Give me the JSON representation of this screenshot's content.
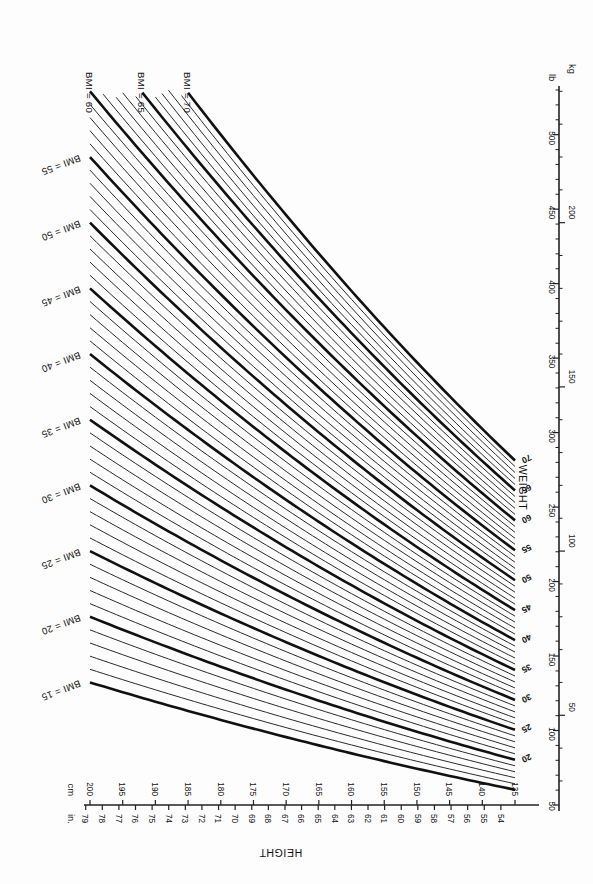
{
  "figure": {
    "orientation": "rotated-180"
  },
  "height_axis": {
    "name": "HEIGHT",
    "unit_left": "in.",
    "unit_right": "cm",
    "in_ticks": [
      80,
      79,
      78,
      77,
      76,
      75,
      74,
      73,
      72,
      71,
      70,
      69,
      68,
      67,
      66,
      65,
      64,
      63,
      62,
      61,
      60,
      59,
      58,
      57,
      56,
      55,
      54
    ],
    "cm_ticks": [
      200,
      195,
      190,
      185,
      180,
      175,
      170,
      165,
      160,
      155,
      150,
      145,
      140,
      135
    ],
    "in_min": 54,
    "in_max": 80,
    "cm_min": 135,
    "cm_max": 200
  },
  "weight_axis": {
    "name": "WEIGHT",
    "unit_left": "kg",
    "unit_right": "lb",
    "lb_ticks": [
      50,
      100,
      150,
      200,
      250,
      300,
      350,
      400,
      450,
      500
    ],
    "lb_minor_step": 10,
    "kg_ticks": [
      50,
      100,
      150,
      200
    ],
    "kg_minor_step": 10,
    "lb_min": 50,
    "lb_max": 530,
    "kg_min": 23,
    "kg_max": 240
  },
  "bmi_labels_left": [
    {
      "text": "BMI = 15",
      "value": 15
    },
    {
      "text": "BMI = 20",
      "value": 20
    },
    {
      "text": "BMI = 25",
      "value": 25
    },
    {
      "text": "BMI = 30",
      "value": 30
    },
    {
      "text": "BMI = 35",
      "value": 35
    },
    {
      "text": "BMI = 40",
      "value": 40
    },
    {
      "text": "BMI = 45",
      "value": 45
    },
    {
      "text": "BMI = 50",
      "value": 50
    },
    {
      "text": "BMI = 55",
      "value": 55
    }
  ],
  "bmi_labels_top": [
    {
      "text": "BMI = 60",
      "value": 60
    },
    {
      "text": "BMI = 65",
      "value": 65
    },
    {
      "text": "BMI = 70",
      "value": 70
    }
  ],
  "bmi_end_labels": [
    "20",
    "25",
    "30",
    "35",
    "40",
    "45",
    "50",
    "55",
    "60",
    "65",
    "70"
  ],
  "colors": {
    "background": "#fdfdfd",
    "line": "#2a2a2a",
    "line_major": "#111111",
    "axis": "#222222",
    "text": "#111111"
  },
  "chart_data": {
    "type": "line",
    "xlabel": "HEIGHT",
    "ylabel": "WEIGHT",
    "x_units": [
      "in.",
      "cm"
    ],
    "y_units": [
      "lb",
      "kg"
    ],
    "xlim_in": [
      54,
      80
    ],
    "xlim_cm": [
      135,
      200
    ],
    "ylim_lb": [
      50,
      530
    ],
    "ylim_kg": [
      23,
      240
    ],
    "grid": false,
    "legend": "inline-labels",
    "note": "Each line is an iso-BMI curve: weight_kg = BMI * (height_m)^2",
    "series": [
      {
        "name": "BMI = 15",
        "bmi": 15,
        "major": true,
        "w_kg_at_135cm": 27.3,
        "w_kg_at_200cm": 60.0
      },
      {
        "name": "BMI = 16",
        "bmi": 16,
        "major": false,
        "w_kg_at_135cm": 29.2,
        "w_kg_at_200cm": 64.0
      },
      {
        "name": "BMI = 17",
        "bmi": 17,
        "major": false,
        "w_kg_at_135cm": 31.0,
        "w_kg_at_200cm": 68.0
      },
      {
        "name": "BMI = 18",
        "bmi": 18,
        "major": false,
        "w_kg_at_135cm": 32.8,
        "w_kg_at_200cm": 72.0
      },
      {
        "name": "BMI = 19",
        "bmi": 19,
        "major": false,
        "w_kg_at_135cm": 34.6,
        "w_kg_at_200cm": 76.0
      },
      {
        "name": "BMI = 20",
        "bmi": 20,
        "major": true,
        "w_kg_at_135cm": 36.5,
        "w_kg_at_200cm": 80.0
      },
      {
        "name": "BMI = 21",
        "bmi": 21,
        "major": false,
        "w_kg_at_135cm": 38.3,
        "w_kg_at_200cm": 84.0
      },
      {
        "name": "BMI = 22",
        "bmi": 22,
        "major": false,
        "w_kg_at_135cm": 40.1,
        "w_kg_at_200cm": 88.0
      },
      {
        "name": "BMI = 23",
        "bmi": 23,
        "major": false,
        "w_kg_at_135cm": 41.9,
        "w_kg_at_200cm": 92.0
      },
      {
        "name": "BMI = 24",
        "bmi": 24,
        "major": false,
        "w_kg_at_135cm": 43.7,
        "w_kg_at_200cm": 96.0
      },
      {
        "name": "BMI = 25",
        "bmi": 25,
        "major": true,
        "w_kg_at_135cm": 45.6,
        "w_kg_at_200cm": 100.0
      },
      {
        "name": "BMI = 26",
        "bmi": 26,
        "major": false,
        "w_kg_at_135cm": 47.4,
        "w_kg_at_200cm": 104.0
      },
      {
        "name": "BMI = 27",
        "bmi": 27,
        "major": false,
        "w_kg_at_135cm": 49.2,
        "w_kg_at_200cm": 108.0
      },
      {
        "name": "BMI = 28",
        "bmi": 28,
        "major": false,
        "w_kg_at_135cm": 51.0,
        "w_kg_at_200cm": 112.0
      },
      {
        "name": "BMI = 29",
        "bmi": 29,
        "major": false,
        "w_kg_at_135cm": 52.9,
        "w_kg_at_200cm": 116.0
      },
      {
        "name": "BMI = 30",
        "bmi": 30,
        "major": true,
        "w_kg_at_135cm": 54.7,
        "w_kg_at_200cm": 120.0
      },
      {
        "name": "BMI = 31",
        "bmi": 31,
        "major": false,
        "w_kg_at_135cm": 56.5,
        "w_kg_at_200cm": 124.0
      },
      {
        "name": "BMI = 32",
        "bmi": 32,
        "major": false,
        "w_kg_at_135cm": 58.3,
        "w_kg_at_200cm": 128.0
      },
      {
        "name": "BMI = 33",
        "bmi": 33,
        "major": false,
        "w_kg_at_135cm": 60.1,
        "w_kg_at_200cm": 132.0
      },
      {
        "name": "BMI = 34",
        "bmi": 34,
        "major": false,
        "w_kg_at_135cm": 62.0,
        "w_kg_at_200cm": 136.0
      },
      {
        "name": "BMI = 35",
        "bmi": 35,
        "major": true,
        "w_kg_at_135cm": 63.8,
        "w_kg_at_200cm": 140.0
      },
      {
        "name": "BMI = 36",
        "bmi": 36,
        "major": false,
        "w_kg_at_135cm": 65.6,
        "w_kg_at_200cm": 144.0
      },
      {
        "name": "BMI = 37",
        "bmi": 37,
        "major": false,
        "w_kg_at_135cm": 67.4,
        "w_kg_at_200cm": 148.0
      },
      {
        "name": "BMI = 38",
        "bmi": 38,
        "major": false,
        "w_kg_at_135cm": 69.3,
        "w_kg_at_200cm": 152.0
      },
      {
        "name": "BMI = 39",
        "bmi": 39,
        "major": false,
        "w_kg_at_135cm": 71.1,
        "w_kg_at_200cm": 156.0
      },
      {
        "name": "BMI = 40",
        "bmi": 40,
        "major": true,
        "w_kg_at_135cm": 72.9,
        "w_kg_at_200cm": 160.0
      },
      {
        "name": "BMI = 41",
        "bmi": 41,
        "major": false,
        "w_kg_at_135cm": 74.7,
        "w_kg_at_200cm": 164.0
      },
      {
        "name": "BMI = 42",
        "bmi": 42,
        "major": false,
        "w_kg_at_135cm": 76.5,
        "w_kg_at_200cm": 168.0
      },
      {
        "name": "BMI = 43",
        "bmi": 43,
        "major": false,
        "w_kg_at_135cm": 78.4,
        "w_kg_at_200cm": 172.0
      },
      {
        "name": "BMI = 44",
        "bmi": 44,
        "major": false,
        "w_kg_at_135cm": 80.2,
        "w_kg_at_200cm": 176.0
      },
      {
        "name": "BMI = 45",
        "bmi": 45,
        "major": true,
        "w_kg_at_135cm": 82.0,
        "w_kg_at_200cm": 180.0
      },
      {
        "name": "BMI = 46",
        "bmi": 46,
        "major": false,
        "w_kg_at_135cm": 83.8,
        "w_kg_at_200cm": 184.0
      },
      {
        "name": "BMI = 47",
        "bmi": 47,
        "major": false,
        "w_kg_at_135cm": 85.7,
        "w_kg_at_200cm": 188.0
      },
      {
        "name": "BMI = 48",
        "bmi": 48,
        "major": false,
        "w_kg_at_135cm": 87.5,
        "w_kg_at_200cm": 192.0
      },
      {
        "name": "BMI = 49",
        "bmi": 49,
        "major": false,
        "w_kg_at_135cm": 89.3,
        "w_kg_at_200cm": 196.0
      },
      {
        "name": "BMI = 50",
        "bmi": 50,
        "major": true,
        "w_kg_at_135cm": 91.1,
        "w_kg_at_200cm": 200.0
      },
      {
        "name": "BMI = 51",
        "bmi": 51,
        "major": false,
        "w_kg_at_135cm": 92.9,
        "w_kg_at_200cm": 204.0
      },
      {
        "name": "BMI = 52",
        "bmi": 52,
        "major": false,
        "w_kg_at_135cm": 94.8,
        "w_kg_at_200cm": 208.0
      },
      {
        "name": "BMI = 53",
        "bmi": 53,
        "major": false,
        "w_kg_at_135cm": 96.6,
        "w_kg_at_200cm": 212.0
      },
      {
        "name": "BMI = 54",
        "bmi": 54,
        "major": false,
        "w_kg_at_135cm": 98.4,
        "w_kg_at_200cm": 216.0
      },
      {
        "name": "BMI = 55",
        "bmi": 55,
        "major": true,
        "w_kg_at_135cm": 100.2,
        "w_kg_at_200cm": 220.0
      },
      {
        "name": "BMI = 56",
        "bmi": 56,
        "major": false,
        "w_kg_at_135cm": 102.1,
        "w_kg_at_200cm": 224.0
      },
      {
        "name": "BMI = 57",
        "bmi": 57,
        "major": false,
        "w_kg_at_135cm": 103.9,
        "w_kg_at_200cm": 228.0
      },
      {
        "name": "BMI = 58",
        "bmi": 58,
        "major": false,
        "w_kg_at_135cm": 105.7,
        "w_kg_at_200cm": 232.0
      },
      {
        "name": "BMI = 59",
        "bmi": 59,
        "major": false,
        "w_kg_at_135cm": 107.5,
        "w_kg_at_200cm": 236.0
      },
      {
        "name": "BMI = 60",
        "bmi": 60,
        "major": true,
        "w_kg_at_135cm": 109.4,
        "w_kg_at_200cm": 240.0
      },
      {
        "name": "BMI = 61",
        "bmi": 61,
        "major": false,
        "w_kg_at_135cm": 111.2,
        "w_kg_at_200cm": 244.0
      },
      {
        "name": "BMI = 62",
        "bmi": 62,
        "major": false,
        "w_kg_at_135cm": 113.0,
        "w_kg_at_200cm": 248.0
      },
      {
        "name": "BMI = 63",
        "bmi": 63,
        "major": false,
        "w_kg_at_135cm": 114.8,
        "w_kg_at_200cm": 252.0
      },
      {
        "name": "BMI = 64",
        "bmi": 64,
        "major": false,
        "w_kg_at_135cm": 116.6,
        "w_kg_at_200cm": 256.0
      },
      {
        "name": "BMI = 65",
        "bmi": 65,
        "major": true,
        "w_kg_at_135cm": 118.5,
        "w_kg_at_200cm": 260.0
      },
      {
        "name": "BMI = 66",
        "bmi": 66,
        "major": false,
        "w_kg_at_135cm": 120.3,
        "w_kg_at_200cm": 264.0
      },
      {
        "name": "BMI = 67",
        "bmi": 67,
        "major": false,
        "w_kg_at_135cm": 122.1,
        "w_kg_at_200cm": 268.0
      },
      {
        "name": "BMI = 68",
        "bmi": 68,
        "major": false,
        "w_kg_at_135cm": 123.9,
        "w_kg_at_200cm": 272.0
      },
      {
        "name": "BMI = 69",
        "bmi": 69,
        "major": false,
        "w_kg_at_135cm": 125.8,
        "w_kg_at_200cm": 276.0
      },
      {
        "name": "BMI = 70",
        "bmi": 70,
        "major": true,
        "w_kg_at_135cm": 127.6,
        "w_kg_at_200cm": 280.0
      }
    ]
  }
}
